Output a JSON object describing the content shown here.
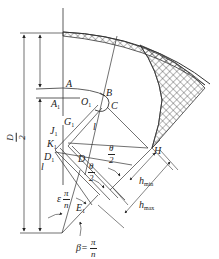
{
  "figure": {
    "type": "engineering cross-section diagram",
    "line_color": "#333333",
    "hatch_color": "#333333",
    "background": "#ffffff"
  },
  "labels": {
    "A": "A",
    "A1": "A",
    "A1_sub": "1",
    "B": "B",
    "C": "C",
    "O1": "O",
    "O1_sub": "1",
    "G1": "G",
    "G1_sub": "1",
    "J1": "J",
    "J1_sub": "1",
    "K1": "K",
    "K1_sub": "1",
    "D1": "D",
    "D1_sub": "1",
    "D": "D",
    "E1": "E",
    "E1_sub": "1",
    "H": "H",
    "l_left": "l",
    "l_inner": "l"
  },
  "dimensions": {
    "D_over_2": {
      "num": "D",
      "den": "2"
    },
    "theta_over_2_a": {
      "num": "θ",
      "den": "2"
    },
    "theta_over_2_b": {
      "num": "θ",
      "den": "2"
    },
    "epsilon_pi_n": {
      "prefix": "ε",
      "num": "π",
      "den": "n"
    },
    "beta": {
      "prefix": "β=",
      "num": "π",
      "den": "n"
    },
    "h_min": {
      "main": "h",
      "sub": "min"
    },
    "h_max": {
      "main": "h",
      "sub": "max"
    }
  }
}
